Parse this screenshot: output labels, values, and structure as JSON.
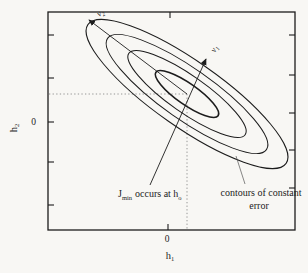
{
  "colors": {
    "paper": "#f8f7f4",
    "ink": "#1c1c1c",
    "dotted": "#8a8a8a",
    "leader": "#555555"
  },
  "plot": {
    "box": {
      "x": 48,
      "y": 12,
      "w": 247,
      "h": 218
    },
    "tick_len": 6
  },
  "axes": {
    "y_label": "h",
    "y_label_sub": "2",
    "x_label": "h",
    "x_label_sub": "1",
    "y_zero": "0",
    "x_zero": "0",
    "left_ticks": [
      35,
      78,
      122,
      162,
      205
    ],
    "right_ticks": [
      35,
      75,
      113,
      150,
      188
    ],
    "top_ticks": [
      170
    ],
    "bottom_ticks": [
      168
    ]
  },
  "contours": {
    "center": {
      "x": 187,
      "y": 94
    },
    "rotation_deg": 35,
    "ellipses": [
      {
        "a": 121,
        "b": 33,
        "sw": 1.0
      },
      {
        "a": 97,
        "b": 25.5,
        "sw": 1.0
      },
      {
        "a": 71,
        "b": 18.5,
        "sw": 1.05
      },
      {
        "a": 38,
        "b": 10.5,
        "sw": 1.6
      }
    ]
  },
  "principal_axes": {
    "v1": {
      "label": "ν",
      "sub": "1"
    },
    "v2": {
      "label": "ν",
      "sub": "2"
    }
  },
  "annotations": {
    "jmin": {
      "j": "J",
      "j_sub": "min",
      "rest": "occurs at h",
      "h_sub": "o"
    },
    "contours_label": {
      "line1": "contours of constant",
      "line2": "error"
    }
  }
}
